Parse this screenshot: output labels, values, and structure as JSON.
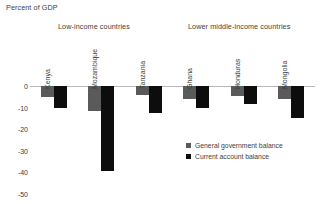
{
  "chart_data": {
    "type": "bar",
    "title": "",
    "ylabel": "Percent of GDP",
    "xlabel": "",
    "ylim": [
      -50,
      0
    ],
    "yticks": [
      0,
      -10,
      -20,
      -30,
      -40,
      -50
    ],
    "ytick_labels": [
      "0",
      "-10",
      "-20",
      "-30",
      "-40",
      "-50"
    ],
    "grid": false,
    "legend_position": "lower-right",
    "categories": [
      "Kenya",
      "Mozambique",
      "Tanzania",
      "Ghana",
      "Honduras",
      "Mongolia"
    ],
    "group_labels": [
      "Low-income countries",
      "Lower middle-income countries"
    ],
    "groups": [
      {
        "name": "Low-income countries",
        "categories": [
          "Kenya",
          "Mozambique",
          "Tanzania"
        ]
      },
      {
        "name": "Lower middle-income countries",
        "categories": [
          "Ghana",
          "Honduras",
          "Mongolia"
        ]
      }
    ],
    "series": [
      {
        "name": "General government balance",
        "color": "#5a5a5a",
        "values": [
          -5.0,
          -11.5,
          -4.0,
          -6.0,
          -4.5,
          -6.0
        ]
      },
      {
        "name": "Current account balance",
        "color": "#0d0d0d",
        "values": [
          -10.0,
          -39.5,
          -12.5,
          -10.0,
          -8.5,
          -15.0
        ]
      }
    ]
  },
  "legend": {
    "items": [
      {
        "label": "General government balance",
        "color": "#5a5a5a"
      },
      {
        "label": "Current account balance",
        "color": "#0d0d0d"
      }
    ]
  }
}
